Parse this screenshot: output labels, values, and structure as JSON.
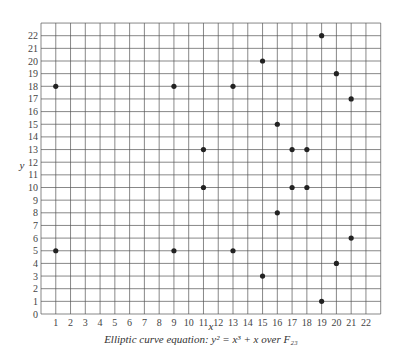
{
  "chart_data": {
    "type": "scatter",
    "title": "",
    "caption_prefix": "Elliptic curve equation",
    "caption_equation": "y² = x³ + x over F₂₃",
    "xlabel": "x",
    "ylabel": "y",
    "xlim": [
      0,
      23
    ],
    "ylim": [
      0,
      23
    ],
    "xticks": [
      1,
      2,
      3,
      4,
      5,
      6,
      7,
      8,
      9,
      10,
      11,
      12,
      13,
      14,
      15,
      16,
      17,
      18,
      19,
      20,
      21,
      22
    ],
    "yticks": [
      0,
      1,
      2,
      3,
      4,
      5,
      6,
      7,
      8,
      9,
      10,
      11,
      12,
      13,
      14,
      15,
      16,
      17,
      18,
      19,
      20,
      21,
      22
    ],
    "grid": true,
    "series": [
      {
        "name": "points",
        "points": [
          [
            1,
            5
          ],
          [
            1,
            18
          ],
          [
            9,
            5
          ],
          [
            9,
            18
          ],
          [
            11,
            10
          ],
          [
            11,
            13
          ],
          [
            13,
            5
          ],
          [
            13,
            18
          ],
          [
            15,
            3
          ],
          [
            15,
            20
          ],
          [
            16,
            8
          ],
          [
            16,
            15
          ],
          [
            17,
            10
          ],
          [
            17,
            13
          ],
          [
            18,
            10
          ],
          [
            18,
            13
          ],
          [
            19,
            1
          ],
          [
            19,
            22
          ],
          [
            20,
            4
          ],
          [
            20,
            19
          ],
          [
            21,
            6
          ],
          [
            21,
            17
          ]
        ]
      }
    ]
  },
  "caption": "Elliptic curve equation: y² = x³ + x over F₂₃",
  "colors": {
    "grid": "#555555",
    "point": "#222222",
    "text": "#333333"
  }
}
